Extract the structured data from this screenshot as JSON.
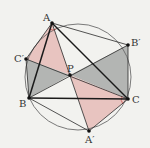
{
  "diagram": {
    "type": "geometry",
    "colors": {
      "background": "#f2f2ef",
      "circle": "#6b6b6b",
      "line": "#2a2a2a",
      "pink_fill": "#e8c4c0",
      "gray_fill": "#b3b5b3",
      "angle_mark": "#c9605a"
    },
    "circle": {
      "cx": 78,
      "cy": 77,
      "r": 53
    },
    "points": {
      "A": {
        "label": "A",
        "x": 52,
        "y": 23
      },
      "B": {
        "label": "B",
        "x": 29,
        "y": 98
      },
      "C": {
        "label": "C",
        "x": 128,
        "y": 99
      },
      "P": {
        "label": "P",
        "x": 70,
        "y": 75
      },
      "A_prime": {
        "label": "A′",
        "x": 89,
        "y": 131
      },
      "B_prime": {
        "label": "B′",
        "x": 128,
        "y": 45
      },
      "C_prime": {
        "label": "C′",
        "x": 26,
        "y": 59
      }
    },
    "regions": [
      {
        "name": "triangle-A-Cprime-P",
        "fill": "pink"
      },
      {
        "name": "triangle-Cprime-B-P",
        "fill": "gray"
      },
      {
        "name": "triangle-P-Bprime-C",
        "fill": "gray"
      },
      {
        "name": "triangle-P-C-Aprime",
        "fill": "pink"
      }
    ]
  }
}
